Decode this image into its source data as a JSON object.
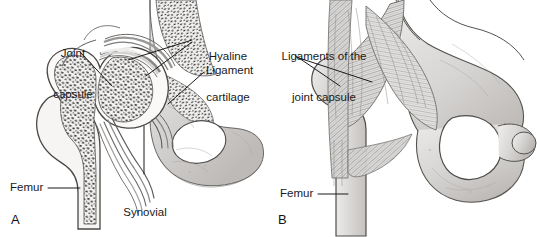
{
  "figure": {
    "width": 537,
    "height": 237,
    "background_color": "#ffffff",
    "text_color": "#1a1a1a",
    "leader_line_color": "#1a1a1a"
  },
  "panels": [
    {
      "letter": "A",
      "caption": "A",
      "description": "Coronal section through the hip joint showing cancellous bone, articular cartilage and joint cavity",
      "labels": [
        {
          "name": "joint-capsule",
          "text": "Joint\ncapsule",
          "lines": [
            "Joint",
            "capsule"
          ]
        },
        {
          "name": "hyaline-cartilage",
          "text": "Hyaline\ncartilage",
          "lines": [
            "Hyaline",
            "cartilage"
          ]
        },
        {
          "name": "ligament",
          "text": "Ligament",
          "lines": [
            "Ligament"
          ]
        },
        {
          "name": "femur",
          "text": "Femur",
          "lines": [
            "Femur"
          ]
        },
        {
          "name": "synovial-cavity",
          "text": "Synovial\ncavity",
          "lines": [
            "Synovial",
            "cavity"
          ]
        }
      ]
    },
    {
      "letter": "B",
      "caption": "B",
      "description": "External view of the hip joint showing the ligaments of the joint capsule",
      "labels": [
        {
          "name": "ligaments-of-the-joint-capsule",
          "text": "Ligaments of the\njoint capsule",
          "lines": [
            "Ligaments of the",
            "joint capsule"
          ]
        },
        {
          "name": "femur",
          "text": "Femur",
          "lines": [
            "Femur"
          ]
        }
      ]
    }
  ],
  "label_text": {
    "a_joint_capsule_l1": "Joint",
    "a_joint_capsule_l2": "capsule",
    "a_hyaline_cartilage_l1": "Hyaline",
    "a_hyaline_cartilage_l2": "cartilage",
    "a_ligament": "Ligament",
    "a_femur": "Femur",
    "a_synovial_cavity_l1": "Synovial",
    "a_synovial_cavity_l2": "cavity",
    "a_panel_letter": "A",
    "b_ligaments_l1": "Ligaments of the",
    "b_ligaments_l2": "joint capsule",
    "b_femur": "Femur",
    "b_panel_letter": "B"
  },
  "colors": {
    "ink": "#1a1a1a",
    "outline": "#4a4a4a",
    "cortical_bone": "#d9d7d5",
    "cortical_bone_dark": "#b5b2b0",
    "cancellous_bone": "#f2f1f0",
    "trabecula": "#2b2b2b",
    "cartilage": "#cfcdcb",
    "capsule": "#e8e6e4",
    "ligament_fiber": "#9a9896",
    "pelvis_fill": "#dcdad8",
    "foramen": "#ffffff",
    "shadow": "#8d8b89"
  }
}
